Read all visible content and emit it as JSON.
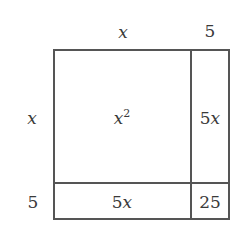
{
  "diagram": {
    "type": "area-model",
    "expression": "(x + 5)^2 = x^2 + 10x + 25",
    "top_labels": [
      {
        "id": "col-x",
        "text": "x",
        "italic": true
      },
      {
        "id": "col-5",
        "text": "5",
        "italic": false
      }
    ],
    "side_labels": [
      {
        "id": "row-x",
        "text": "x",
        "italic": true
      },
      {
        "id": "row-5",
        "text": "5",
        "italic": false
      }
    ],
    "cells": {
      "x_x": {
        "base": "x",
        "sup": "2"
      },
      "x_5": {
        "coef": "5",
        "var": "x"
      },
      "5_x": {
        "coef": "5",
        "var": "x"
      },
      "5_5": {
        "text": "25"
      }
    },
    "colors": {
      "line": "#555555",
      "text": "#3a3a3a",
      "background": "#ffffff"
    }
  }
}
